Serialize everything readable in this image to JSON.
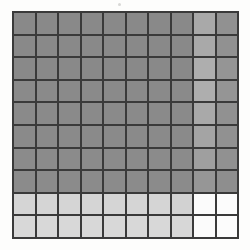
{
  "figure": {
    "name": "grayscale-grid-heatmap",
    "background_color": "#fdfdfc",
    "border_color": "#3a3a3a",
    "artifact_note": "faint-speck-top-center"
  },
  "chart_data": {
    "type": "heatmap",
    "title": "",
    "subtitle": "",
    "xlabel": "",
    "ylabel": "",
    "grid": true,
    "legend_position": "none",
    "colormap": "grayscale",
    "rows": 10,
    "cols": 10,
    "x": [
      1,
      2,
      3,
      4,
      5,
      6,
      7,
      8,
      9,
      10
    ],
    "y": [
      1,
      2,
      3,
      4,
      5,
      6,
      7,
      8,
      9,
      10
    ],
    "xticklabels": [],
    "yticklabels": [],
    "vmin": 0,
    "vmax": 1,
    "values": [
      [
        0.55,
        0.55,
        0.55,
        0.55,
        0.55,
        0.55,
        0.55,
        0.55,
        0.68,
        0.58
      ],
      [
        0.55,
        0.55,
        0.55,
        0.55,
        0.55,
        0.55,
        0.55,
        0.55,
        0.68,
        0.58
      ],
      [
        0.55,
        0.55,
        0.55,
        0.55,
        0.55,
        0.55,
        0.55,
        0.55,
        0.7,
        0.6
      ],
      [
        0.55,
        0.55,
        0.55,
        0.55,
        0.55,
        0.55,
        0.55,
        0.55,
        0.7,
        0.6
      ],
      [
        0.55,
        0.55,
        0.55,
        0.55,
        0.55,
        0.55,
        0.55,
        0.55,
        0.68,
        0.58
      ],
      [
        0.55,
        0.55,
        0.55,
        0.55,
        0.55,
        0.55,
        0.55,
        0.55,
        0.66,
        0.58
      ],
      [
        0.55,
        0.55,
        0.55,
        0.55,
        0.55,
        0.55,
        0.55,
        0.55,
        0.64,
        0.58
      ],
      [
        0.55,
        0.55,
        0.55,
        0.55,
        0.55,
        0.55,
        0.55,
        0.55,
        0.6,
        0.56
      ],
      [
        0.85,
        0.85,
        0.85,
        0.85,
        0.85,
        0.85,
        0.85,
        0.84,
        0.99,
        0.99
      ],
      [
        0.86,
        0.86,
        0.86,
        0.86,
        0.86,
        0.86,
        0.86,
        0.86,
        0.99,
        0.99
      ]
    ],
    "colors": [
      [
        "#898989",
        "#898989",
        "#898989",
        "#898989",
        "#898989",
        "#898989",
        "#898989",
        "#898989",
        "#a9a9a9",
        "#919191"
      ],
      [
        "#898989",
        "#898989",
        "#898989",
        "#898989",
        "#898989",
        "#898989",
        "#898989",
        "#898989",
        "#a9a9a9",
        "#919191"
      ],
      [
        "#898989",
        "#898989",
        "#898989",
        "#898989",
        "#898989",
        "#898989",
        "#898989",
        "#898989",
        "#aeaeae",
        "#959595"
      ],
      [
        "#8a8a8a",
        "#8a8a8a",
        "#8a8a8a",
        "#8a8a8a",
        "#8a8a8a",
        "#8a8a8a",
        "#8a8a8a",
        "#8a8a8a",
        "#aeaeae",
        "#959595"
      ],
      [
        "#8a8a8a",
        "#8a8a8a",
        "#8a8a8a",
        "#8a8a8a",
        "#8a8a8a",
        "#8a8a8a",
        "#8a8a8a",
        "#8a8a8a",
        "#a9a9a9",
        "#919191"
      ],
      [
        "#8a8a8a",
        "#8a8a8a",
        "#8a8a8a",
        "#8a8a8a",
        "#8a8a8a",
        "#8a8a8a",
        "#8a8a8a",
        "#8a8a8a",
        "#a4a4a4",
        "#919191"
      ],
      [
        "#8b8b8b",
        "#8b8b8b",
        "#8b8b8b",
        "#8b8b8b",
        "#8b8b8b",
        "#8b8b8b",
        "#8b8b8b",
        "#8b8b8b",
        "#9f9f9f",
        "#919191"
      ],
      [
        "#8b8b8b",
        "#8b8b8b",
        "#8b8b8b",
        "#8b8b8b",
        "#8b8b8b",
        "#8b8b8b",
        "#8b8b8b",
        "#8b8b8b",
        "#969696",
        "#8e8e8e"
      ],
      [
        "#d5d5d5",
        "#d5d5d5",
        "#d5d5d5",
        "#d5d5d5",
        "#d5d5d5",
        "#d5d5d5",
        "#d5d5d5",
        "#d2d2d2",
        "#fbfbfb",
        "#fcfcfc"
      ],
      [
        "#d8d8d8",
        "#d8d8d8",
        "#d8d8d8",
        "#d8d8d8",
        "#d8d8d8",
        "#d8d8d8",
        "#d8d8d8",
        "#d7d7d7",
        "#fbfbfb",
        "#fcfcfc"
      ]
    ]
  }
}
